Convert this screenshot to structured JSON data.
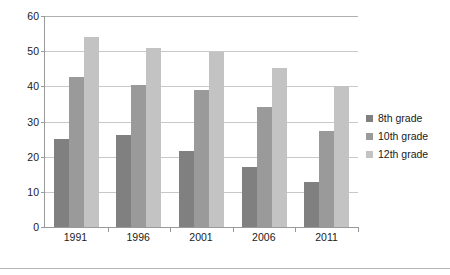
{
  "chart_data": {
    "type": "bar",
    "title": "",
    "subtitle": "",
    "xlabel": "",
    "ylabel": "",
    "categories": [
      "1991",
      "1996",
      "2001",
      "2006",
      "2011"
    ],
    "series": [
      {
        "name": "8th grade",
        "color": "#808080",
        "values": [
          25.0,
          26.2,
          21.5,
          17.0,
          12.7
        ]
      },
      {
        "name": "10th grade",
        "color": "#9a9a9a",
        "values": [
          42.6,
          40.3,
          39.0,
          34.0,
          27.2
        ]
      },
      {
        "name": "12th grade",
        "color": "#c3c3c3",
        "values": [
          54.0,
          50.8,
          49.7,
          45.3,
          40.0
        ]
      }
    ],
    "ylim": [
      0,
      60
    ],
    "yticks": [
      0,
      10,
      20,
      30,
      40,
      50,
      60
    ],
    "ytick_labels": [
      "0",
      "10",
      "20",
      "30",
      "40",
      "50",
      "60"
    ],
    "grid": true,
    "grid_axis": "y",
    "legend": true,
    "legend_position": "right",
    "bar_orientation": "vertical",
    "axis_color": "#9a9a9a",
    "gridline_color": "#c8c8c8",
    "background_color": "#ffffff"
  },
  "legend_items": [
    {
      "label": "8th grade",
      "color": "#808080"
    },
    {
      "label": "10th grade",
      "color": "#9a9a9a"
    },
    {
      "label": "12th grade",
      "color": "#c3c3c3"
    }
  ]
}
